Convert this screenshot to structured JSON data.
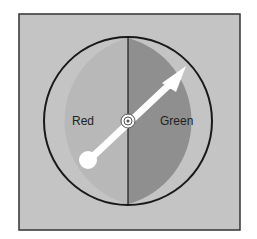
{
  "spinner": {
    "sections": [
      {
        "label": "Red",
        "shade": "#b8b8b8"
      },
      {
        "label": "Green",
        "shade": "#8f8f8f"
      }
    ],
    "background": "#c4c4c4",
    "border": "#222222",
    "pointer_color": "#ffffff"
  }
}
